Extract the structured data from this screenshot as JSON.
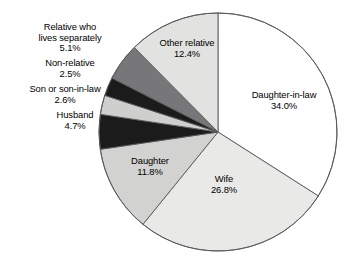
{
  "chart_data": {
    "type": "pie",
    "title": "",
    "subtitle": "",
    "xlabel": "",
    "ylabel": "",
    "legend_position": "none",
    "grid": false,
    "units": "percent",
    "start_angle_deg": 0,
    "direction": "clockwise",
    "categories": [
      "Daughter-in-law",
      "Wife",
      "Daughter",
      "Husband",
      "Son or son-in-law",
      "Non-relative",
      "Relative who lives separately",
      "Other relative"
    ],
    "values": [
      34.0,
      26.8,
      11.8,
      4.7,
      2.6,
      2.5,
      5.1,
      12.4
    ],
    "value_labels": [
      "34.0%",
      "26.8%",
      "11.8%",
      "4.7%",
      "2.6%",
      "2.5%",
      "5.1%",
      "12.4%"
    ],
    "slices": [
      {
        "name": "Daughter-in-law",
        "label_line1": "Daughter-in-law",
        "label_line2": "34.0%",
        "value": 34.0,
        "color": "#ffffff",
        "label_placement": "inside"
      },
      {
        "name": "Wife",
        "label_line1": "Wife",
        "label_line2": "26.8%",
        "value": 26.8,
        "color": "#e9e9e7",
        "label_placement": "inside"
      },
      {
        "name": "Daughter",
        "label_line1": "Daughter",
        "label_line2": "11.8%",
        "value": 11.8,
        "color": "#d2d2d0",
        "label_placement": "inside"
      },
      {
        "name": "Husband",
        "label_line1": "Husband",
        "label_line2": "4.7%",
        "value": 4.7,
        "color": "#1b1b1b",
        "label_placement": "outside-left"
      },
      {
        "name": "Son or son-in-law",
        "label_line1": "Son or son-in-law",
        "label_line2": "2.6%",
        "value": 2.6,
        "color": "#cfcfcd",
        "label_placement": "outside-left"
      },
      {
        "name": "Non-relative",
        "label_line1": "Non-relative",
        "label_line2": "2.5%",
        "value": 2.5,
        "color": "#1b1b1b",
        "label_placement": "outside-left"
      },
      {
        "name": "Relative who lives separately",
        "label_line1": "Relative who",
        "label_line2": "lives separately",
        "label_line3": "5.1%",
        "value": 5.1,
        "color": "#77777a",
        "label_placement": "outside-left"
      },
      {
        "name": "Other relative",
        "label_line1": "Other relative",
        "label_line2": "12.4%",
        "value": 12.4,
        "color": "#e2e2e0",
        "label_placement": "inside"
      }
    ],
    "colors": {
      "outline": "#58585a",
      "text": "#000000",
      "background": "#ffffff"
    }
  }
}
